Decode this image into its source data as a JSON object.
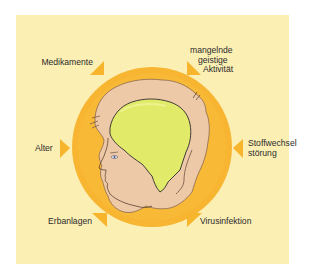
{
  "diagram": {
    "type": "causes-around-head",
    "colors": {
      "background": "#fcefb4",
      "circle": "#f7b531",
      "arrow": "#f6b52d",
      "hair": "#eec9a8",
      "brain": "#e2ea6a",
      "text": "#2b2b2b"
    },
    "center_icon": "head-profile-with-brain-icon",
    "factors": [
      {
        "id": "medikamente",
        "lines": [
          "Medikamente"
        ],
        "arrow": "arrow-down-right"
      },
      {
        "id": "geistige-aktivitaet",
        "lines": [
          "mangelnde",
          "geistige",
          "Aktivität"
        ],
        "arrow": "arrow-down-left"
      },
      {
        "id": "alter",
        "lines": [
          "Alter"
        ],
        "arrow": "arrow-right"
      },
      {
        "id": "stoffwechselstoerung",
        "lines": [
          "Stoffwechsel",
          "störung"
        ],
        "arrow": "arrow-left"
      },
      {
        "id": "erbanlagen",
        "lines": [
          "Erbanlagen"
        ],
        "arrow": "arrow-up-right"
      },
      {
        "id": "virusinfektion",
        "lines": [
          "Virusinfektion"
        ],
        "arrow": "arrow-up-left"
      }
    ]
  }
}
